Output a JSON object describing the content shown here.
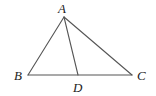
{
  "diagram": {
    "type": "triangle",
    "colors": {
      "line": "#555555",
      "label": "#222222",
      "background": "#ffffff"
    },
    "points": {
      "A": {
        "label": "A",
        "x": 64,
        "y": 17,
        "label_x": 58,
        "label_y": 13
      },
      "B": {
        "label": "B",
        "x": 28,
        "y": 75,
        "label_x": 14,
        "label_y": 80
      },
      "C": {
        "label": "C",
        "x": 132,
        "y": 75,
        "label_x": 137,
        "label_y": 80
      },
      "D": {
        "label": "D",
        "x": 78,
        "y": 75,
        "label_x": 73,
        "label_y": 92
      }
    },
    "segments": [
      {
        "name": "AB",
        "from": "A",
        "to": "B"
      },
      {
        "name": "AC",
        "from": "A",
        "to": "C"
      },
      {
        "name": "BC",
        "from": "B",
        "to": "C"
      },
      {
        "name": "AD",
        "from": "A",
        "to": "D"
      }
    ]
  }
}
